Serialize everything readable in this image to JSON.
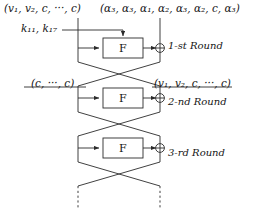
{
  "figure": {
    "width": 253,
    "height": 216,
    "background": "#ffffff",
    "line_color": "#2b2b2b",
    "text_color": "#141414"
  },
  "labels": {
    "top_left_state": "(v₁, v₂, c, ···, c)",
    "top_right_state": "(α₃, α₃, α₁, α₂, α₃, α₂, c, α₃)",
    "keys": "k₁₁, k₁₇",
    "round1": "1-st Round",
    "round2_left_state": "(c, ···, c)",
    "round2_right_state": "(v₁, v₂, c, ···, c)",
    "round2": "2-nd Round",
    "round3": "3-rd Round"
  },
  "function_boxes": [
    {
      "label": "F",
      "round": "1-st Round"
    },
    {
      "label": "F",
      "round": "2-nd Round"
    },
    {
      "label": "F",
      "round": "3-rd Round"
    }
  ],
  "operators": [
    {
      "name": "xor",
      "glyph": "⊕",
      "round": "1-st Round"
    },
    {
      "name": "xor",
      "glyph": "⊕",
      "round": "2-nd Round"
    },
    {
      "name": "xor",
      "glyph": "⊕",
      "round": "3-rd Round"
    }
  ],
  "geometry": {
    "left_rail_x": 78,
    "right_rail_x": 160,
    "fbox": {
      "x": 103,
      "y_round1": 38,
      "width": 40,
      "height": 20
    },
    "round_pitch": 50,
    "crossover_top_y": 62,
    "crossover_bottom_y": 86,
    "dashed_tail_y": 196,
    "state_line_y_round2": 87
  }
}
